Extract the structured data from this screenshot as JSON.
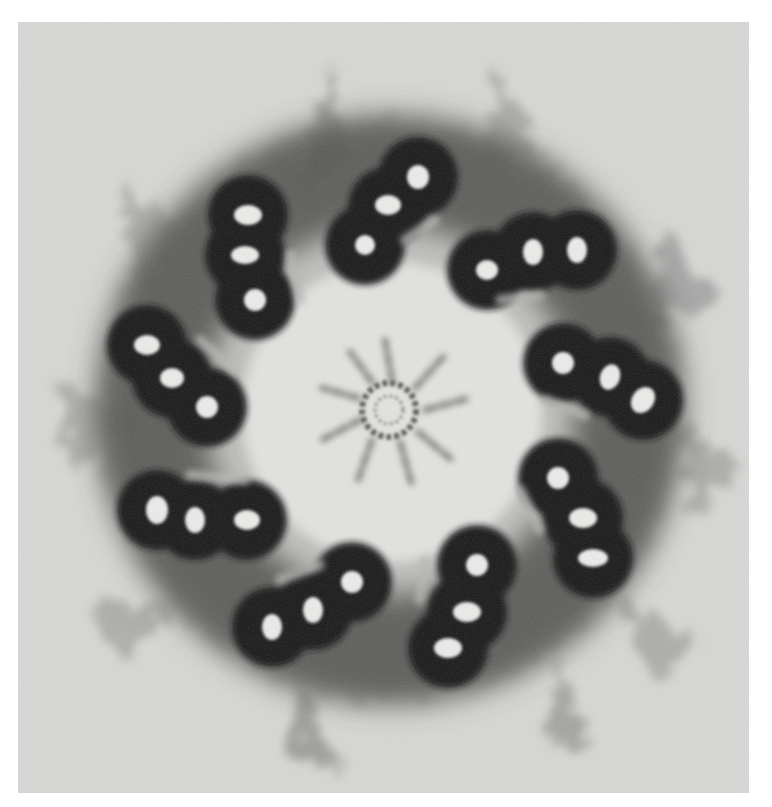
{
  "image": {
    "subject": "Centriole cross-section (electron micrograph)",
    "description": "Nine triplet microtubule blades arranged in a ring around a central cartwheel hub with radial spokes, surrounded by diffuse pericentriolar material",
    "triplet_count": 9,
    "colors": {
      "background": "#d8d8d6",
      "halo": "#9a9a98",
      "triplet_wall": "#111111",
      "lumen": "#efefed",
      "lumen_center": "#e6e6e4",
      "spoke": "#6c6c6a"
    }
  }
}
